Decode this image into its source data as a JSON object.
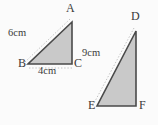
{
  "figure": {
    "background_color": "#fbfbfb",
    "fill_color": "#c9c9c9",
    "stroke_color": "#4a4a4a",
    "guide_color": "#c0c0c0",
    "text_color": "#3a3a3a",
    "triangles": [
      {
        "name": "triangle-abc",
        "vertices": [
          {
            "label": "A",
            "x": 72,
            "y": 22
          },
          {
            "label": "B",
            "x": 28,
            "y": 64
          },
          {
            "label": "C",
            "x": 72,
            "y": 64
          }
        ],
        "measurements": [
          {
            "label": "6cm",
            "side": "BA",
            "value": 6,
            "unit": "cm"
          },
          {
            "label": "4cm",
            "side": "BC",
            "value": 4,
            "unit": "cm"
          }
        ]
      },
      {
        "name": "triangle-def",
        "vertices": [
          {
            "label": "D",
            "x": 136,
            "y": 31
          },
          {
            "label": "E",
            "x": 97,
            "y": 106
          },
          {
            "label": "F",
            "x": 136,
            "y": 106
          }
        ],
        "measurements": [
          {
            "label": "9cm",
            "side": "ED",
            "value": 9,
            "unit": "cm"
          }
        ]
      }
    ],
    "labels": {
      "A": "A",
      "B": "B",
      "C": "C",
      "D": "D",
      "E": "E",
      "F": "F",
      "six_cm": "6cm",
      "four_cm": "4cm",
      "nine_cm": "9cm"
    }
  }
}
